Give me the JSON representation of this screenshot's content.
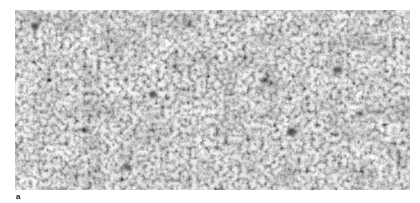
{
  "figure": {
    "panel_label": "a",
    "image": {
      "description": "grayscale granular micrograph texture",
      "base_color": "#b8b8b8",
      "light_grain_color": "#e6e6e6",
      "dark_grain_color": "#6e6e6e",
      "dark_spots": [
        {
          "x": 277,
          "y": 122,
          "r": 4
        },
        {
          "x": 138,
          "y": 85,
          "r": 3
        },
        {
          "x": 323,
          "y": 60,
          "r": 3
        },
        {
          "x": 20,
          "y": 16,
          "r": 3
        },
        {
          "x": 112,
          "y": 157,
          "r": 3
        },
        {
          "x": 345,
          "y": 104,
          "r": 2.5
        },
        {
          "x": 70,
          "y": 120,
          "r": 2.5
        },
        {
          "x": 250,
          "y": 70,
          "r": 2.5
        }
      ]
    }
  }
}
